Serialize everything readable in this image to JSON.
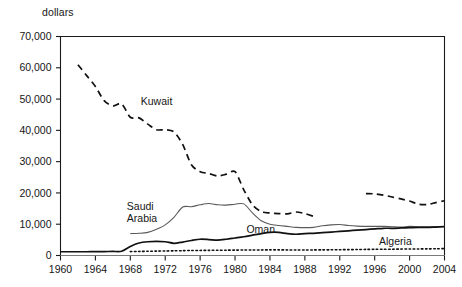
{
  "chart_data": {
    "type": "line",
    "title": "",
    "xlabel": "",
    "ylabel": "dollars",
    "ylim": [
      0,
      70000
    ],
    "xlim": [
      1960,
      2004
    ],
    "grid": false,
    "legend_position": "inline-annotations",
    "ytick_labels": [
      "0",
      "10,000",
      "20,000",
      "30,000",
      "40,000",
      "50,000",
      "60,000",
      "70,000"
    ],
    "ytick_values": [
      0,
      10000,
      20000,
      30000,
      40000,
      50000,
      60000,
      70000
    ],
    "xtick_labels": [
      "1960",
      "1964",
      "1968",
      "1972",
      "1976",
      "1980",
      "1984",
      "1988",
      "1992",
      "1996",
      "2000",
      "2004"
    ],
    "xtick_values": [
      1960,
      1964,
      1968,
      1972,
      1976,
      1980,
      1984,
      1988,
      1992,
      1996,
      2000,
      2004
    ],
    "series": [
      {
        "name": "Kuwait",
        "style": "dashed",
        "color": "#111111",
        "width": 1.7,
        "label_x": 1969.2,
        "label_y": 48000,
        "segments": [
          {
            "x": [
              1962,
              1963,
              1964,
              1965,
              1966,
              1967,
              1968,
              1969,
              1970,
              1971,
              1972,
              1973,
              1974,
              1975,
              1976,
              1977,
              1978,
              1979,
              1980,
              1981,
              1982,
              1983,
              1984,
              1985,
              1986,
              1987,
              1988,
              1989
            ],
            "y": [
              61000,
              57500,
              54000,
              49500,
              47800,
              48500,
              44200,
              44000,
              42000,
              40200,
              40200,
              39500,
              35500,
              29000,
              26800,
              26200,
              25400,
              26000,
              26800,
              21000,
              16200,
              14000,
              13600,
              13400,
              13300,
              13900,
              13400,
              12500
            ]
          },
          {
            "x": [
              1995,
              1996,
              1997,
              1998,
              1999,
              2000,
              2001,
              2002,
              2003,
              2004
            ],
            "y": [
              19800,
              19700,
              19300,
              18700,
              18100,
              17400,
              16400,
              16300,
              16900,
              17500
            ]
          }
        ]
      },
      {
        "name": "Saudi Arabia",
        "style": "solid",
        "color": "#5a5a5a",
        "width": 1.1,
        "label_x": 1967.6,
        "label_y": 14600,
        "label_lines": [
          "Saudi",
          "Arabia"
        ],
        "segments": [
          {
            "x": [
              1968,
              1969,
              1970,
              1971,
              1972,
              1973,
              1974,
              1975,
              1976,
              1977,
              1978,
              1979,
              1980,
              1981,
              1982,
              1983,
              1984,
              1985,
              1986,
              1987,
              1988,
              1989,
              1990,
              1991,
              1992,
              1993,
              1994,
              1995,
              1996,
              1997,
              1998,
              1999,
              2000,
              2001,
              2002,
              2003,
              2004
            ],
            "y": [
              7000,
              7100,
              7400,
              8400,
              9800,
              12200,
              15500,
              15600,
              16200,
              16600,
              16200,
              16100,
              16400,
              16500,
              13600,
              11100,
              10000,
              9600,
              9300,
              9000,
              8900,
              9000,
              9500,
              9800,
              9900,
              9600,
              9400,
              9300,
              9300,
              9300,
              9200,
              9100,
              9300,
              9200,
              9200,
              9200,
              9300
            ]
          }
        ]
      },
      {
        "name": "Oman",
        "style": "solid",
        "color": "#111111",
        "width": 1.7,
        "label_x": 1981.3,
        "label_y": 7300,
        "segments": [
          {
            "x": [
              1960,
              1961,
              1962,
              1963,
              1964,
              1965,
              1966,
              1967,
              1968,
              1969,
              1970,
              1971,
              1972,
              1973,
              1974,
              1975,
              1976,
              1977,
              1978,
              1979,
              1980,
              1981,
              1982,
              1983,
              1984,
              1985,
              1986,
              1987,
              1988,
              1989,
              1990,
              1991,
              1992,
              1993,
              1994,
              1995,
              1996,
              1997,
              1998,
              1999,
              2000,
              2001,
              2002,
              2003,
              2004
            ],
            "y": [
              1200,
              1200,
              1200,
              1200,
              1250,
              1250,
              1300,
              1350,
              2900,
              4000,
              4400,
              4500,
              4400,
              3900,
              4300,
              4800,
              5200,
              5100,
              4900,
              5200,
              5600,
              6000,
              6500,
              7000,
              7400,
              7400,
              7000,
              6800,
              7000,
              7100,
              7300,
              7500,
              7700,
              7900,
              8100,
              8300,
              8500,
              8700,
              8700,
              8800,
              8900,
              9000,
              9000,
              9100,
              9200
            ]
          }
        ]
      },
      {
        "name": "Algeria",
        "style": "dotted",
        "color": "#111111",
        "width": 1.6,
        "label_x": 1996.5,
        "label_y": 3500,
        "segments": [
          {
            "x": [
              1968,
              1969,
              1970,
              1971,
              1972,
              1973,
              1974,
              1975,
              1976,
              1977,
              1978,
              1979,
              1980,
              1981,
              1982,
              1983,
              1984,
              1985,
              1986,
              1987,
              1988,
              1989,
              1990,
              1991,
              1992,
              1993,
              1994,
              1995,
              1996,
              1997,
              1998,
              1999,
              2000,
              2001,
              2002,
              2003,
              2004
            ],
            "y": [
              1250,
              1300,
              1350,
              1400,
              1450,
              1500,
              1550,
              1600,
              1620,
              1650,
              1680,
              1700,
              1720,
              1740,
              1750,
              1780,
              1800,
              1800,
              1780,
              1760,
              1760,
              1780,
              1800,
              1820,
              1850,
              1880,
              1900,
              1950,
              1980,
              2000,
              2020,
              2050,
              2080,
              2100,
              2120,
              2150,
              2200
            ]
          }
        ]
      }
    ]
  }
}
